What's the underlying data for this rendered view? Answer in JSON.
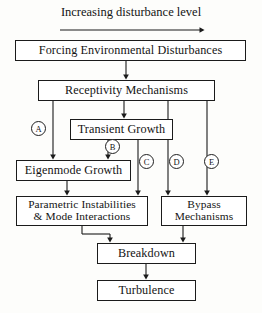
{
  "diagram": {
    "title": "Increasing disturbance level",
    "nodes": {
      "forcing": "Forcing Environmental Disturbances",
      "receptivity": "Receptivity Mechanisms",
      "transient": "Transient Growth",
      "eigenmode": "Eigenmode Growth",
      "parametric": "Parametric Instabilities\n& Mode Interactions",
      "bypass": "Bypass\nMechanisms",
      "breakdown": "Breakdown",
      "turbulence": "Turbulence"
    },
    "path_markers": {
      "a": "A",
      "b": "B",
      "c": "C",
      "d": "D",
      "e": "E"
    },
    "colors": {
      "line": "#1b1b1b",
      "box_border": "#1b1b1b",
      "background": "#fdfdfb",
      "text": "#141414"
    }
  }
}
